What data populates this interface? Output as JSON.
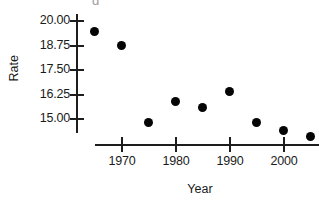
{
  "chart_data": {
    "type": "scatter",
    "title": "",
    "xlabel": "Year",
    "ylabel": "Rate",
    "x": [
      1965,
      1970,
      1975,
      1980,
      1985,
      1990,
      1995,
      2000,
      2005
    ],
    "values": [
      19.4,
      18.7,
      14.8,
      15.9,
      15.6,
      16.4,
      14.8,
      14.4,
      14.1
    ],
    "series": [
      {
        "name": "Rate",
        "points": [
          {
            "x": 1965,
            "y": 19.4
          },
          {
            "x": 1970,
            "y": 18.7
          },
          {
            "x": 1975,
            "y": 14.8
          },
          {
            "x": 1980,
            "y": 15.9
          },
          {
            "x": 1985,
            "y": 15.6
          },
          {
            "x": 1990,
            "y": 16.4
          },
          {
            "x": 1995,
            "y": 14.8
          },
          {
            "x": 2000,
            "y": 14.4
          },
          {
            "x": 2005,
            "y": 14.1
          }
        ]
      }
    ],
    "xlim": [
      1963,
      2007
    ],
    "ylim": [
      13.8,
      20.3
    ],
    "xticks": [
      1970,
      1980,
      1990,
      2000
    ],
    "xtick_labels": [
      "1970",
      "1980",
      "1990",
      "2000"
    ],
    "yticks": [
      15.0,
      16.25,
      17.5,
      18.75,
      20.0
    ],
    "ytick_labels": [
      "15.00",
      "16.25",
      "17.50",
      "18.75",
      "20.00"
    ],
    "grid": false,
    "legend": "none",
    "marker_color": "#050505",
    "axis_color": "#1d1d1d"
  },
  "axes": {
    "y_title": "Rate",
    "x_title": "Year"
  },
  "partial_top_text": "g"
}
